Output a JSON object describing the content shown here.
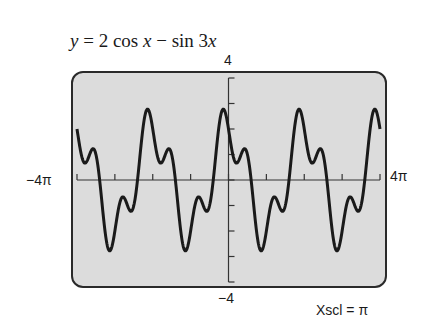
{
  "chart_data": {
    "type": "line",
    "title": "y = 2 cos x − sin 3x",
    "function": "y = 2 cos x - sin 3x",
    "xlabel": "",
    "ylabel": "",
    "xlim": [
      -12.566,
      12.566
    ],
    "ylim": [
      -4,
      4
    ],
    "x_tick_labels": {
      "left": "−4π",
      "right": "4π"
    },
    "y_tick_labels": {
      "top": "4",
      "bottom": "−4"
    },
    "xscl": "π",
    "yscl": 1,
    "grid": false,
    "legend": null,
    "frame": "calculator-screen",
    "series": [
      {
        "name": "y = 2 cos x − sin 3x",
        "color": "#1a1a1a",
        "sample_points": [
          {
            "x": -12.566,
            "y": 2.0
          },
          {
            "x": -9.425,
            "y": -2.0
          },
          {
            "x": -6.283,
            "y": 2.0
          },
          {
            "x": -3.142,
            "y": -2.0
          },
          {
            "x": 0,
            "y": 2.0
          },
          {
            "x": 3.142,
            "y": -2.0
          },
          {
            "x": 6.283,
            "y": 2.0
          },
          {
            "x": 9.425,
            "y": -2.0
          },
          {
            "x": 12.566,
            "y": 2.0
          }
        ]
      }
    ]
  },
  "labels": {
    "title_prefix": "y",
    "title_eq": " = 2 cos ",
    "title_x": "x",
    "title_minus": " − sin 3",
    "title_x2": "x",
    "ymax": "4",
    "ymin": "−4",
    "xmin": "−4π",
    "xmax": "4π",
    "xscl_label": "Xscl = π"
  },
  "colors": {
    "screen_bg": "#dcdcdc",
    "frame": "#2a2a2a",
    "curve": "#1a1a1a"
  }
}
